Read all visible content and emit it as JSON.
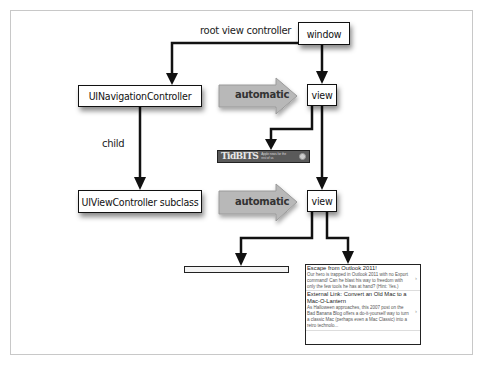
{
  "diagram": {
    "nodes": {
      "window": "window",
      "nav_controller": "UINavigationController",
      "vc_subclass": "UIViewController subclass",
      "view_top": "view",
      "view_bottom": "view"
    },
    "edge_labels": {
      "root_view_controller": "root view controller",
      "child": "child",
      "automatic_top": "automatic",
      "automatic_bottom": "automatic"
    },
    "colors": {
      "line": "#111111",
      "auto_arrow_fill": "#b8b8b8",
      "frame_border": "#c8c8c8"
    }
  },
  "tidbits_banner": {
    "logo": "TidBITS",
    "tagline": "Apple news for the rest of us"
  },
  "table_view": {
    "cells": [
      {
        "title": "Escape from Outlook 2011!",
        "body": "Our hero is trapped in Outlook 2011 with no Export command! Can he blast his way to freedom with only the few tools he has at hand? (Hint: Yes.)"
      },
      {
        "title": "External Link: Convert an Old Mac to a Mac-O-Lantern",
        "body": "As Halloween approaches, this 2007 post on the Bad Banana Blog offers a do-it-yourself way to turn a classic Mac (perhaps even a Mac Classic) into a retro technolo..."
      }
    ]
  }
}
